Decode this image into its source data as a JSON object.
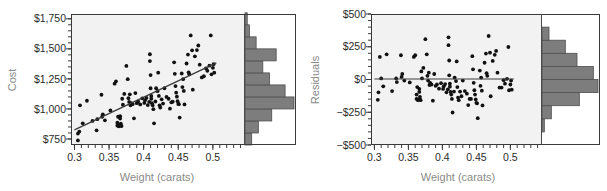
{
  "figure": {
    "background_color": "#ffffff",
    "plot_area_color": "#f2f2f2",
    "hist_bar_color": "#7d7d7d",
    "point_color": "#111111",
    "line_color": "#3a3a3a",
    "axis_title_color": "#8a8a8a",
    "tick_label_color": "#2b2b2b"
  },
  "chart_data": [
    {
      "type": "scatter",
      "id": "cost-vs-weight",
      "title": "",
      "xlabel": "Weight (carats)",
      "ylabel": "Cost",
      "xlim": [
        0.295,
        0.545
      ],
      "ylim": [
        700,
        1790
      ],
      "xticks": [
        0.3,
        0.35,
        0.4,
        0.45,
        0.5
      ],
      "xticklabels": [
        "0.3",
        "0.35",
        "0.4",
        "0.45",
        "0.5"
      ],
      "yticks": [
        750,
        1000,
        1250,
        1500,
        1750
      ],
      "yticklabels": [
        "$750",
        "$1,000",
        "$1,250",
        "$1,500",
        "$1,750"
      ],
      "x_minor_tick_step": 0.01,
      "y_minor_tick_step": 50,
      "grid": false,
      "legend": null,
      "fit_line": {
        "label": "least-squares regression line",
        "x": [
          0.3,
          0.505
        ],
        "y": [
          826,
          1383
        ]
      },
      "marginal_histogram": {
        "orientation": "horizontal",
        "axis": "y",
        "bin_width": 100,
        "bins": [
          {
            "y_low": 700,
            "y_high": 800,
            "count": 3
          },
          {
            "y_low": 800,
            "y_high": 900,
            "count": 6
          },
          {
            "y_low": 900,
            "y_high": 1000,
            "count": 12
          },
          {
            "y_low": 1000,
            "y_high": 1100,
            "count": 22
          },
          {
            "y_low": 1100,
            "y_high": 1200,
            "count": 18
          },
          {
            "y_low": 1200,
            "y_high": 1300,
            "count": 11
          },
          {
            "y_low": 1300,
            "y_high": 1400,
            "count": 8
          },
          {
            "y_low": 1400,
            "y_high": 1500,
            "count": 14
          },
          {
            "y_low": 1500,
            "y_high": 1600,
            "count": 5
          },
          {
            "y_low": 1600,
            "y_high": 1700,
            "count": 2
          },
          {
            "y_low": 1700,
            "y_high": 1800,
            "count": 1
          }
        ]
      },
      "points": [
        [
          0.305,
          738
        ],
        [
          0.305,
          795
        ],
        [
          0.307,
          812
        ],
        [
          0.308,
          1030
        ],
        [
          0.312,
          880
        ],
        [
          0.318,
          1068
        ],
        [
          0.326,
          900
        ],
        [
          0.332,
          822
        ],
        [
          0.333,
          915
        ],
        [
          0.339,
          1118
        ],
        [
          0.34,
          935
        ],
        [
          0.341,
          955
        ],
        [
          0.344,
          905
        ],
        [
          0.352,
          988
        ],
        [
          0.358,
          1210
        ],
        [
          0.36,
          1230
        ],
        [
          0.362,
          885
        ],
        [
          0.362,
          862
        ],
        [
          0.363,
          935
        ],
        [
          0.364,
          855
        ],
        [
          0.365,
          862
        ],
        [
          0.366,
          940
        ],
        [
          0.366,
          920
        ],
        [
          0.367,
          862
        ],
        [
          0.367,
          878
        ],
        [
          0.368,
          858
        ],
        [
          0.369,
          1085
        ],
        [
          0.37,
          1035
        ],
        [
          0.372,
          1125
        ],
        [
          0.375,
          1358
        ],
        [
          0.377,
          1248
        ],
        [
          0.378,
          1090
        ],
        [
          0.379,
          1058
        ],
        [
          0.38,
          1122
        ],
        [
          0.381,
          1030
        ],
        [
          0.382,
          1048
        ],
        [
          0.384,
          1040
        ],
        [
          0.386,
          922
        ],
        [
          0.388,
          1132
        ],
        [
          0.39,
          1048
        ],
        [
          0.392,
          1062
        ],
        [
          0.395,
          1038
        ],
        [
          0.398,
          1088
        ],
        [
          0.401,
          1050
        ],
        [
          0.402,
          1072
        ],
        [
          0.404,
          1092
        ],
        [
          0.406,
          1032
        ],
        [
          0.408,
          1058
        ],
        [
          0.409,
          1455
        ],
        [
          0.409,
          1398
        ],
        [
          0.41,
          1282
        ],
        [
          0.41,
          1172
        ],
        [
          0.411,
          1108
        ],
        [
          0.411,
          1085
        ],
        [
          0.412,
          1048
        ],
        [
          0.413,
          1030
        ],
        [
          0.414,
          998
        ],
        [
          0.415,
          880
        ],
        [
          0.417,
          1062
        ],
        [
          0.418,
          1172
        ],
        [
          0.42,
          1148
        ],
        [
          0.421,
          1302
        ],
        [
          0.422,
          1108
        ],
        [
          0.423,
          1030
        ],
        [
          0.424,
          1012
        ],
        [
          0.426,
          1080
        ],
        [
          0.428,
          1045
        ],
        [
          0.43,
          1172
        ],
        [
          0.433,
          1100
        ],
        [
          0.436,
          1085
        ],
        [
          0.438,
          1002
        ],
        [
          0.44,
          1055
        ],
        [
          0.442,
          1060
        ],
        [
          0.444,
          1388
        ],
        [
          0.445,
          1292
        ],
        [
          0.446,
          1190
        ],
        [
          0.447,
          1135
        ],
        [
          0.448,
          1102
        ],
        [
          0.449,
          1065
        ],
        [
          0.45,
          1042
        ],
        [
          0.451,
          1040
        ],
        [
          0.452,
          928
        ],
        [
          0.455,
          1295
        ],
        [
          0.456,
          1182
        ],
        [
          0.457,
          1248
        ],
        [
          0.458,
          1150
        ],
        [
          0.459,
          1038
        ],
        [
          0.462,
          1378
        ],
        [
          0.464,
          1452
        ],
        [
          0.465,
          1305
        ],
        [
          0.466,
          1288
        ],
        [
          0.468,
          1612
        ],
        [
          0.47,
          1488
        ],
        [
          0.471,
          1160
        ],
        [
          0.474,
          1438
        ],
        [
          0.477,
          1490
        ],
        [
          0.479,
          1528
        ],
        [
          0.481,
          1368
        ],
        [
          0.484,
          1262
        ],
        [
          0.487,
          1272
        ],
        [
          0.49,
          1338
        ],
        [
          0.492,
          1318
        ],
        [
          0.495,
          1360
        ],
        [
          0.497,
          1612
        ],
        [
          0.498,
          1288
        ],
        [
          0.5,
          1342
        ],
        [
          0.501,
          1372
        ],
        [
          0.502,
          1302
        ]
      ]
    },
    {
      "type": "scatter",
      "id": "residuals-vs-weight",
      "title": "",
      "xlabel": "Weight (carats)",
      "ylabel": "Residuals",
      "xlim": [
        0.295,
        0.545
      ],
      "ylim": [
        -500,
        500
      ],
      "xticks": [
        0.3,
        0.35,
        0.4,
        0.45,
        0.5
      ],
      "xticklabels": [
        "0.3",
        "0.35",
        "0.4",
        "0.45",
        "0.5"
      ],
      "yticks": [
        -500,
        -250,
        0,
        250,
        500
      ],
      "yticklabels": [
        "−$500",
        "−$250",
        "$0",
        "$250",
        "$500"
      ],
      "x_minor_tick_step": 0.01,
      "y_minor_tick_step": 50,
      "grid": false,
      "legend": null,
      "fit_line": {
        "label": "zero residual reference line",
        "x": [
          0.3,
          0.505
        ],
        "y": [
          4,
          4
        ]
      },
      "marginal_histogram": {
        "orientation": "horizontal",
        "axis": "y",
        "bin_width": 100,
        "bins": [
          {
            "y_low": -400,
            "y_high": -300,
            "count": 1
          },
          {
            "y_low": -300,
            "y_high": -200,
            "count": 4
          },
          {
            "y_low": -200,
            "y_high": -100,
            "count": 16
          },
          {
            "y_low": -100,
            "y_high": 0,
            "count": 24
          },
          {
            "y_low": 0,
            "y_high": 100,
            "count": 22
          },
          {
            "y_low": 100,
            "y_high": 200,
            "count": 15
          },
          {
            "y_low": 200,
            "y_high": 300,
            "count": 10
          },
          {
            "y_low": 300,
            "y_high": 400,
            "count": 3
          }
        ]
      },
      "points": [
        [
          0.305,
          -155
        ],
        [
          0.306,
          -98
        ],
        [
          0.308,
          172
        ],
        [
          0.31,
          8
        ],
        [
          0.313,
          -52
        ],
        [
          0.318,
          192
        ],
        [
          0.326,
          -88
        ],
        [
          0.332,
          8
        ],
        [
          0.333,
          -20
        ],
        [
          0.339,
          185
        ],
        [
          0.34,
          20
        ],
        [
          0.341,
          42
        ],
        [
          0.344,
          -8
        ],
        [
          0.352,
          -22
        ],
        [
          0.358,
          172
        ],
        [
          0.36,
          185
        ],
        [
          0.362,
          -115
        ],
        [
          0.362,
          -148
        ],
        [
          0.363,
          -58
        ],
        [
          0.364,
          -158
        ],
        [
          0.365,
          -152
        ],
        [
          0.366,
          -72
        ],
        [
          0.366,
          -95
        ],
        [
          0.367,
          -152
        ],
        [
          0.367,
          -132
        ],
        [
          0.368,
          -158
        ],
        [
          0.369,
          62
        ],
        [
          0.37,
          8
        ],
        [
          0.372,
          88
        ],
        [
          0.375,
          308
        ],
        [
          0.377,
          192
        ],
        [
          0.378,
          28
        ],
        [
          0.379,
          -8
        ],
        [
          0.38,
          52
        ],
        [
          0.381,
          -42
        ],
        [
          0.382,
          -25
        ],
        [
          0.384,
          -38
        ],
        [
          0.386,
          -162
        ],
        [
          0.388,
          42
        ],
        [
          0.39,
          -48
        ],
        [
          0.392,
          -38
        ],
        [
          0.395,
          -70
        ],
        [
          0.398,
          -28
        ],
        [
          0.401,
          -72
        ],
        [
          0.402,
          -52
        ],
        [
          0.404,
          -35
        ],
        [
          0.406,
          -98
        ],
        [
          0.408,
          -75
        ],
        [
          0.409,
          322
        ],
        [
          0.409,
          262
        ],
        [
          0.41,
          145
        ],
        [
          0.41,
          32
        ],
        [
          0.411,
          -32
        ],
        [
          0.411,
          -55
        ],
        [
          0.412,
          -95
        ],
        [
          0.413,
          -115
        ],
        [
          0.414,
          -148
        ],
        [
          0.415,
          -252
        ],
        [
          0.417,
          -92
        ],
        [
          0.418,
          15
        ],
        [
          0.42,
          -12
        ],
        [
          0.421,
          138
        ],
        [
          0.422,
          -58
        ],
        [
          0.423,
          -138
        ],
        [
          0.424,
          -158
        ],
        [
          0.426,
          -92
        ],
        [
          0.428,
          -128
        ],
        [
          0.43,
          -8
        ],
        [
          0.433,
          -88
        ],
        [
          0.436,
          -108
        ],
        [
          0.438,
          -195
        ],
        [
          0.44,
          -148
        ],
        [
          0.442,
          -148
        ],
        [
          0.444,
          178
        ],
        [
          0.445,
          78
        ],
        [
          0.446,
          -25
        ],
        [
          0.447,
          -82
        ],
        [
          0.448,
          -115
        ],
        [
          0.449,
          -152
        ],
        [
          0.45,
          -178
        ],
        [
          0.451,
          -182
        ],
        [
          0.452,
          -295
        ],
        [
          0.455,
          68
        ],
        [
          0.456,
          -48
        ],
        [
          0.457,
          15
        ],
        [
          0.458,
          -85
        ],
        [
          0.459,
          -198
        ],
        [
          0.462,
          128
        ],
        [
          0.464,
          198
        ],
        [
          0.465,
          48
        ],
        [
          0.466,
          28
        ],
        [
          0.468,
          332
        ],
        [
          0.47,
          205
        ],
        [
          0.471,
          -128
        ],
        [
          0.474,
          142
        ],
        [
          0.477,
          188
        ],
        [
          0.479,
          218
        ],
        [
          0.481,
          52
        ],
        [
          0.484,
          -62
        ],
        [
          0.487,
          -62
        ],
        [
          0.49,
          -5
        ],
        [
          0.492,
          -32
        ],
        [
          0.495,
          5
        ],
        [
          0.497,
          248
        ],
        [
          0.498,
          -82
        ],
        [
          0.5,
          -38
        ],
        [
          0.501,
          -8
        ],
        [
          0.502,
          -78
        ]
      ]
    }
  ]
}
